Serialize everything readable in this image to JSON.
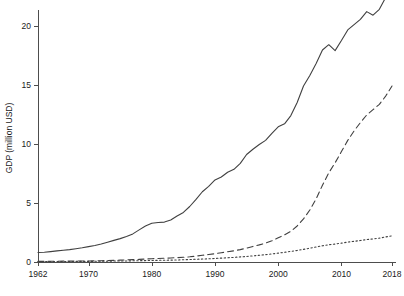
{
  "chart_data": {
    "type": "line",
    "title": "",
    "subtitle": "",
    "xlabel": "",
    "ylabel": "GDP (million USD)",
    "xlim": [
      1962,
      2018
    ],
    "ylim": [
      0,
      21
    ],
    "grid": false,
    "legend": "none",
    "xticks": [
      1962,
      1970,
      1980,
      1990,
      2000,
      2010,
      2018
    ],
    "xtick_labels": [
      "1962",
      "1970",
      "1980",
      "1990",
      "2000",
      "2010",
      "2018"
    ],
    "yticks": [
      0,
      5,
      10,
      15,
      20
    ],
    "ytick_labels": [
      "0",
      "5",
      "10",
      "15",
      "20"
    ],
    "x": [
      1962,
      1963,
      1964,
      1965,
      1966,
      1967,
      1968,
      1969,
      1970,
      1971,
      1972,
      1973,
      1974,
      1975,
      1976,
      1977,
      1978,
      1979,
      1980,
      1981,
      1982,
      1983,
      1984,
      1985,
      1986,
      1987,
      1988,
      1989,
      1990,
      1991,
      1992,
      1993,
      1994,
      1995,
      1996,
      1997,
      1998,
      1999,
      2000,
      2001,
      2002,
      2003,
      2004,
      2005,
      2006,
      2007,
      2008,
      2009,
      2010,
      2011,
      2012,
      2013,
      2014,
      2015,
      2016,
      2017,
      2018
    ],
    "series": [
      {
        "name": "series-solid",
        "style": "solid",
        "color": "#404040",
        "values": [
          0.8,
          0.83,
          0.88,
          0.94,
          1.0,
          1.05,
          1.12,
          1.2,
          1.3,
          1.4,
          1.52,
          1.68,
          1.83,
          1.98,
          2.16,
          2.38,
          2.72,
          3.05,
          3.28,
          3.35,
          3.38,
          3.55,
          3.9,
          4.2,
          4.7,
          5.3,
          5.95,
          6.4,
          6.95,
          7.2,
          7.6,
          7.85,
          8.35,
          9.1,
          9.55,
          9.95,
          10.3,
          10.9,
          11.45,
          11.7,
          12.4,
          13.5,
          14.9,
          15.8,
          16.8,
          17.95,
          18.4,
          17.9,
          18.75,
          19.65,
          20.1,
          20.55,
          21.2,
          20.9,
          21.4,
          22.4,
          23.3
        ]
      },
      {
        "name": "series-dashed",
        "style": "dashed",
        "color": "#555555",
        "values": [
          0.05,
          0.05,
          0.06,
          0.06,
          0.07,
          0.07,
          0.08,
          0.08,
          0.09,
          0.1,
          0.11,
          0.13,
          0.14,
          0.16,
          0.18,
          0.2,
          0.22,
          0.25,
          0.28,
          0.3,
          0.32,
          0.34,
          0.37,
          0.4,
          0.44,
          0.5,
          0.57,
          0.63,
          0.7,
          0.78,
          0.87,
          0.95,
          1.05,
          1.18,
          1.32,
          1.45,
          1.6,
          1.8,
          2.05,
          2.3,
          2.6,
          3.05,
          3.65,
          4.4,
          5.35,
          6.5,
          7.55,
          8.4,
          9.35,
          10.3,
          11.1,
          11.8,
          12.45,
          12.9,
          13.35,
          14.05,
          14.9
        ]
      },
      {
        "name": "series-dotted",
        "style": "dotted",
        "color": "#666666",
        "values": [
          0.03,
          0.03,
          0.03,
          0.04,
          0.04,
          0.04,
          0.05,
          0.05,
          0.05,
          0.06,
          0.06,
          0.07,
          0.08,
          0.08,
          0.09,
          0.1,
          0.11,
          0.12,
          0.13,
          0.14,
          0.15,
          0.16,
          0.17,
          0.19,
          0.21,
          0.23,
          0.25,
          0.27,
          0.3,
          0.33,
          0.36,
          0.39,
          0.43,
          0.47,
          0.52,
          0.57,
          0.62,
          0.68,
          0.75,
          0.82,
          0.9,
          0.98,
          1.07,
          1.17,
          1.27,
          1.37,
          1.46,
          1.52,
          1.6,
          1.68,
          1.75,
          1.82,
          1.9,
          1.95,
          2.02,
          2.12,
          2.22
        ]
      }
    ]
  },
  "layout": {
    "plot_left": 38,
    "plot_right": 392,
    "plot_top": 14,
    "plot_bottom": 262
  }
}
